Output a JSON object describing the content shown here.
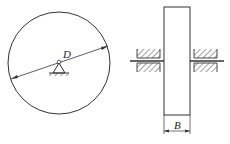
{
  "diagram": {
    "front_view": {
      "label_diameter": "D",
      "shape": "circle",
      "support": "pivot-triangle-on-ground"
    },
    "side_view": {
      "label_width": "B",
      "shape": "rectangle",
      "bearings": [
        "left-bearing-hatched",
        "right-bearing-hatched"
      ],
      "axle": "horizontal-shaft"
    },
    "colors": {
      "stroke": "#333333",
      "background": "#ffffff"
    }
  }
}
